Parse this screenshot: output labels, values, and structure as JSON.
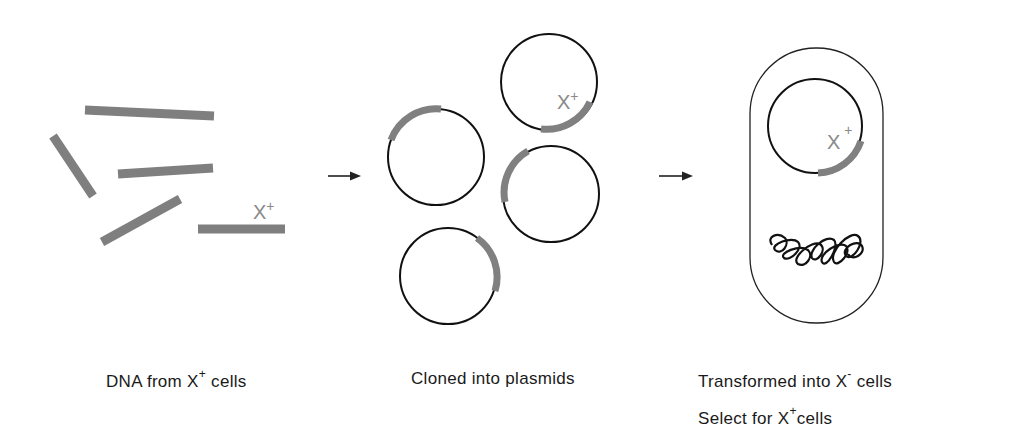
{
  "diagram": {
    "title": "",
    "colors": {
      "dna_fragment": "#7f7f7f",
      "plasmid_outline": "#111111",
      "insert": "#808080",
      "label_gray": "#8a8a8a",
      "text": "#1a1a1a"
    },
    "steps": [
      {
        "id": "dna",
        "caption_prefix": "DNA from X",
        "caption_sup": "+",
        "caption_suffix": " cells",
        "fragment_label": "X",
        "fragment_label_sup": "+"
      },
      {
        "id": "plasmids",
        "caption": "Cloned into plasmids",
        "plasmid_label": "X",
        "plasmid_label_sup": "+"
      },
      {
        "id": "cells",
        "caption_line1_prefix": "Transformed into X",
        "caption_line1_sup": "-",
        "caption_line1_suffix": " cells",
        "caption_line2_prefix": "Select for X",
        "caption_line2_sup": "+",
        "caption_line2_suffix": "cells",
        "plasmid_label": "X",
        "plasmid_label_sup": "+"
      }
    ],
    "arrows": [
      "step1-to-step2",
      "step2-to-step3"
    ]
  }
}
